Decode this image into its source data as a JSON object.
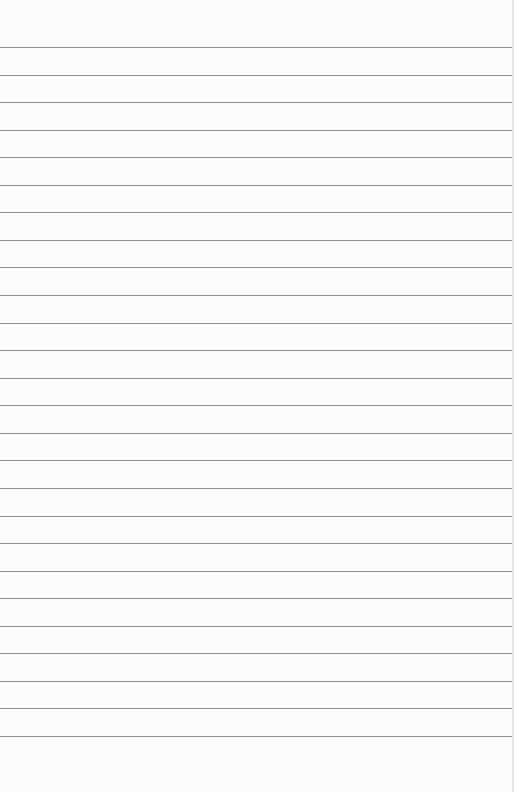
{
  "paper": {
    "type": "lined-paper",
    "background_color": "#fcfcfc",
    "line_color": "#8f8f8f",
    "line_count": 26,
    "first_line_y": 47,
    "line_spacing": 27.56
  }
}
